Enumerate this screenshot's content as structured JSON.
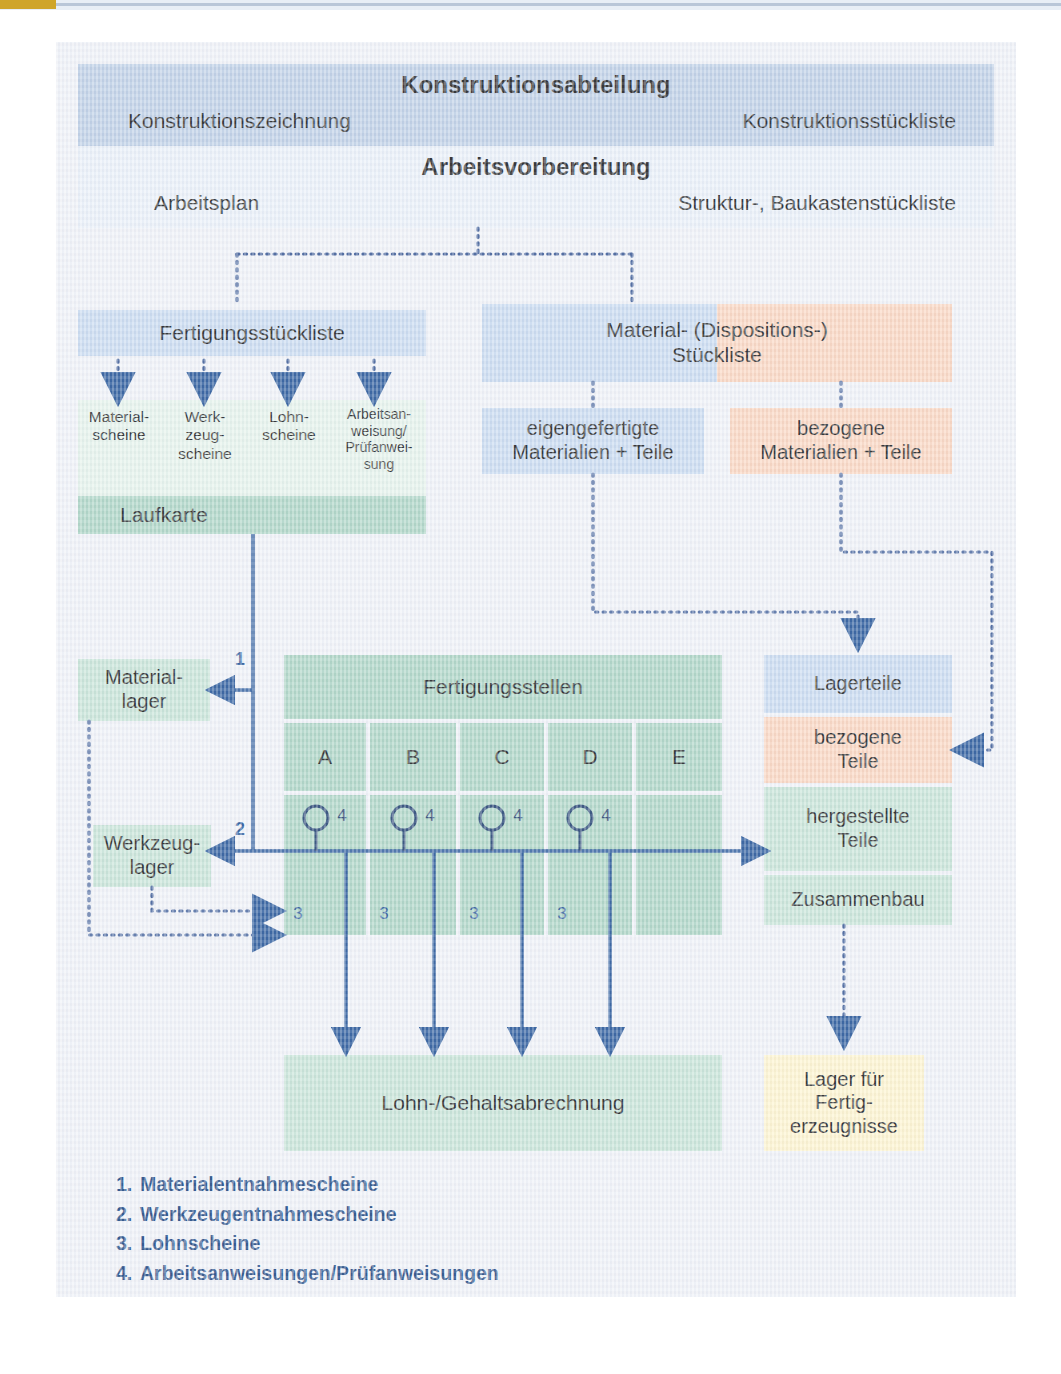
{
  "diagram": {
    "title_top": "Konstruktionsabteilung",
    "top_band": {
      "heading": "Konstruktionsabteilung",
      "left": "Konstruktionszeichnung",
      "right": "Konstruktionsstückliste"
    },
    "second_band": {
      "heading": "Arbeitsvorbereitung",
      "left": "Arbeitsplan",
      "right": "Struktur-, Baukastenstückliste"
    },
    "fertigungsstueckliste": "Fertigungsstückliste",
    "scheine": [
      "Material-\nscheine",
      "Werk-\nzeug-\nscheine",
      "Lohn-\nscheine",
      "Arbeitsan-\nweisung/\nPrüfanwei-\nsung"
    ],
    "laufkarte": "Laufkarte",
    "material_dispo": "Material- (Dispositions-)\nStückliste",
    "eigengefertigt": "eigengefertigte\nMaterialien + Teile",
    "bezogen": "bezogene\nMaterialien + Teile",
    "materiallager": "Material-\nlager",
    "werkzeuglager": "Werkzeug-\nlager",
    "fertigungsstellen": {
      "title": "Fertigungsstellen",
      "columns": [
        "A",
        "B",
        "C",
        "D",
        "E"
      ],
      "top_marks": [
        "4",
        "4",
        "4",
        "4"
      ],
      "bottom_marks": [
        "3",
        "3",
        "3",
        "3"
      ]
    },
    "lager_column": {
      "lagerteile": "Lagerteile",
      "bezogene_teile": "bezogene\nTeile",
      "hergestellte_teile": "hergestellte\nTeile",
      "zusammenbau": "Zusammenbau"
    },
    "lohn_gehalt": "Lohn-/Gehaltsabrechnung",
    "lager_fertig": "Lager für\nFertig-\nerzeugnisse",
    "flow_labels": {
      "one": "1",
      "two": "2"
    },
    "legend": [
      {
        "num": "1.",
        "text": "Materialentnahmescheine"
      },
      {
        "num": "2.",
        "text": "Werkzeugentnahmescheine"
      },
      {
        "num": "3.",
        "text": "Lohnscheine"
      },
      {
        "num": "4.",
        "text": "Arbeitsanweisungen/Prüfanweisungen"
      }
    ],
    "colors": {
      "blue": "#b9cce4",
      "pale_blue": "#c5d8ef",
      "light_blue": "#e8eff8",
      "peach": "#fad3bc",
      "green": "#a7d2c1",
      "pale_green": "#c3e2d4",
      "mint": "#e3f2ea",
      "cream": "#fdf3cb",
      "line_blue": "#1f5196",
      "legend_text": "#17437f"
    }
  }
}
